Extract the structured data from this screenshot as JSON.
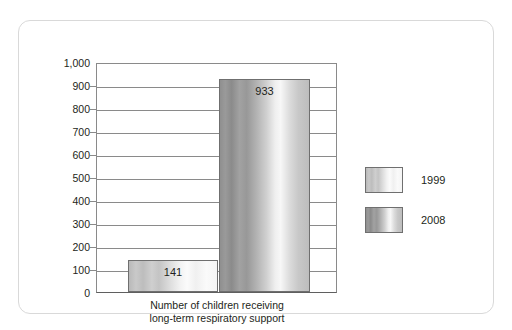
{
  "chart_data": {
    "type": "bar",
    "title": "",
    "subtitle": "",
    "xlabel": "Number of children receiving long-term respiratory support",
    "xlabel_line1": "Number of children receiving",
    "xlabel_line2": "long-term respiratory support",
    "ylabel": "",
    "categories": [
      "Number of children receiving long-term respiratory support"
    ],
    "series": [
      {
        "name": "1999",
        "values": [
          141
        ],
        "color": "#cccccc"
      },
      {
        "name": "2008",
        "values": [
          933
        ],
        "color": "#999999"
      }
    ],
    "bars": [
      {
        "series": "1999",
        "value": 141,
        "label": "141"
      },
      {
        "series": "2008",
        "value": 933,
        "label": "933"
      }
    ],
    "ylim": [
      0,
      1000
    ],
    "ytick_values": [
      1000,
      900,
      800,
      700,
      600,
      500,
      400,
      300,
      200,
      100,
      0
    ],
    "ytick_labels": [
      "1,000",
      "900",
      "800",
      "700",
      "600",
      "500",
      "400",
      "300",
      "200",
      "100",
      "0"
    ],
    "grid": true,
    "legend_position": "right",
    "legend_entries": [
      "1999",
      "2008"
    ]
  },
  "legend": {
    "items": [
      {
        "label": "1999"
      },
      {
        "label": "2008"
      }
    ]
  },
  "colors": {
    "frame_border": "#d9d9d9",
    "axis": "#8a8a8a",
    "text": "#231f20",
    "bar_1999": "#cccccc",
    "bar_2008": "#999999"
  }
}
